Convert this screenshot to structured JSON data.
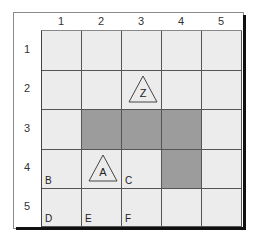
{
  "columns": [
    "1",
    "2",
    "3",
    "4",
    "5"
  ],
  "rows": [
    "1",
    "2",
    "3",
    "4",
    "5"
  ],
  "shaded_cells": [
    [
      3,
      2
    ],
    [
      3,
      3
    ],
    [
      3,
      4
    ],
    [
      4,
      4
    ]
  ],
  "colors": {
    "cell": "#ececec",
    "shaded": "#9c9c9c",
    "line": "#555555",
    "shadow": "#111111"
  },
  "markers": [
    {
      "label": "Z",
      "row": 2,
      "col": 3
    },
    {
      "label": "A",
      "row": 4,
      "col": 2
    }
  ],
  "corner_labels": [
    {
      "label": "B",
      "row": 4,
      "col": 1
    },
    {
      "label": "C",
      "row": 4,
      "col": 3
    },
    {
      "label": "D",
      "row": 5,
      "col": 1
    },
    {
      "label": "E",
      "row": 5,
      "col": 2
    },
    {
      "label": "F",
      "row": 5,
      "col": 3
    }
  ]
}
